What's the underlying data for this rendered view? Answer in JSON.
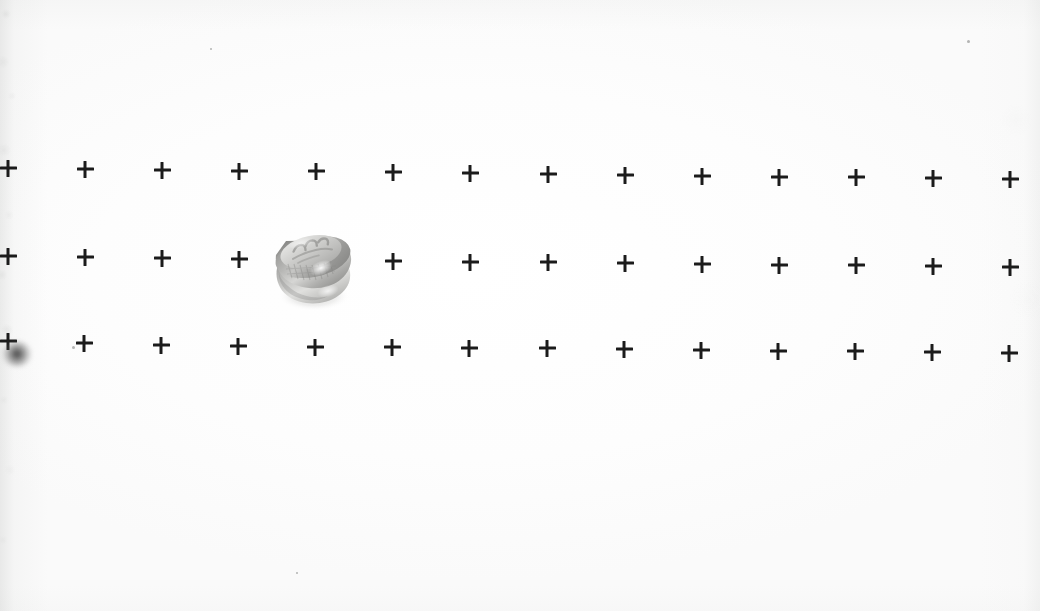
{
  "scene": {
    "width": 1040,
    "height": 611,
    "background_color": "#fefefe",
    "description": "Scanned photograph of a small machined metal cap resting on a white calibration sheet printed with a grid of bold plus-sign fiducial marks",
    "media": "grayscale halftone print on white paper"
  },
  "grid": {
    "label": "calibration fiducial grid",
    "rows": 3,
    "columns": 14,
    "column_spacing_px": 77,
    "row_spacing_px": 88,
    "cross_size_px": 17,
    "cross_stroke_px": 3,
    "cross_color": "#1b1b1b",
    "tilt_note": "grid drifts ~10px lower toward the right edge",
    "row_labels": [
      "row-1",
      "row-2",
      "row-3"
    ],
    "marks": [
      {
        "row": 1,
        "col": 1,
        "x": 8,
        "y": 168,
        "clipped": true,
        "occluded": false
      },
      {
        "row": 1,
        "col": 2,
        "x": 85,
        "y": 169,
        "clipped": false,
        "occluded": false
      },
      {
        "row": 1,
        "col": 3,
        "x": 162,
        "y": 170,
        "clipped": false,
        "occluded": false
      },
      {
        "row": 1,
        "col": 4,
        "x": 239,
        "y": 171,
        "clipped": false,
        "occluded": false
      },
      {
        "row": 1,
        "col": 5,
        "x": 316,
        "y": 171,
        "clipped": false,
        "occluded": false
      },
      {
        "row": 1,
        "col": 6,
        "x": 393,
        "y": 172,
        "clipped": false,
        "occluded": false
      },
      {
        "row": 1,
        "col": 7,
        "x": 470,
        "y": 173,
        "clipped": false,
        "occluded": false
      },
      {
        "row": 1,
        "col": 8,
        "x": 548,
        "y": 174,
        "clipped": false,
        "occluded": false
      },
      {
        "row": 1,
        "col": 9,
        "x": 625,
        "y": 175,
        "clipped": false,
        "occluded": false
      },
      {
        "row": 1,
        "col": 10,
        "x": 702,
        "y": 176,
        "clipped": false,
        "occluded": false
      },
      {
        "row": 1,
        "col": 11,
        "x": 779,
        "y": 177,
        "clipped": false,
        "occluded": false
      },
      {
        "row": 1,
        "col": 12,
        "x": 856,
        "y": 177,
        "clipped": false,
        "occluded": false
      },
      {
        "row": 1,
        "col": 13,
        "x": 933,
        "y": 178,
        "clipped": false,
        "occluded": false
      },
      {
        "row": 1,
        "col": 14,
        "x": 1010,
        "y": 179,
        "clipped": true,
        "occluded": false
      },
      {
        "row": 2,
        "col": 1,
        "x": 8,
        "y": 256,
        "clipped": true,
        "occluded": false
      },
      {
        "row": 2,
        "col": 2,
        "x": 85,
        "y": 257,
        "clipped": false,
        "occluded": false
      },
      {
        "row": 2,
        "col": 3,
        "x": 162,
        "y": 258,
        "clipped": false,
        "occluded": false
      },
      {
        "row": 2,
        "col": 4,
        "x": 239,
        "y": 259,
        "clipped": false,
        "occluded": false
      },
      {
        "row": 2,
        "col": 5,
        "x": 316,
        "y": 260,
        "clipped": false,
        "occluded": true
      },
      {
        "row": 2,
        "col": 6,
        "x": 393,
        "y": 261,
        "clipped": false,
        "occluded": false
      },
      {
        "row": 2,
        "col": 7,
        "x": 470,
        "y": 262,
        "clipped": false,
        "occluded": false
      },
      {
        "row": 2,
        "col": 8,
        "x": 548,
        "y": 262,
        "clipped": false,
        "occluded": false
      },
      {
        "row": 2,
        "col": 9,
        "x": 625,
        "y": 263,
        "clipped": false,
        "occluded": false
      },
      {
        "row": 2,
        "col": 10,
        "x": 702,
        "y": 264,
        "clipped": false,
        "occluded": false
      },
      {
        "row": 2,
        "col": 11,
        "x": 779,
        "y": 265,
        "clipped": false,
        "occluded": false
      },
      {
        "row": 2,
        "col": 12,
        "x": 856,
        "y": 265,
        "clipped": false,
        "occluded": false
      },
      {
        "row": 2,
        "col": 13,
        "x": 933,
        "y": 266,
        "clipped": false,
        "occluded": false
      },
      {
        "row": 2,
        "col": 14,
        "x": 1010,
        "y": 267,
        "clipped": true,
        "occluded": false
      },
      {
        "row": 3,
        "col": 1,
        "x": 8,
        "y": 341,
        "clipped": true,
        "occluded": false
      },
      {
        "row": 3,
        "col": 2,
        "x": 84,
        "y": 343,
        "clipped": false,
        "occluded": false
      },
      {
        "row": 3,
        "col": 3,
        "x": 161,
        "y": 345,
        "clipped": false,
        "occluded": false
      },
      {
        "row": 3,
        "col": 4,
        "x": 238,
        "y": 346,
        "clipped": false,
        "occluded": false
      },
      {
        "row": 3,
        "col": 5,
        "x": 315,
        "y": 347,
        "clipped": false,
        "occluded": false
      },
      {
        "row": 3,
        "col": 6,
        "x": 392,
        "y": 347,
        "clipped": false,
        "occluded": false
      },
      {
        "row": 3,
        "col": 7,
        "x": 469,
        "y": 348,
        "clipped": false,
        "occluded": false
      },
      {
        "row": 3,
        "col": 8,
        "x": 547,
        "y": 348,
        "clipped": false,
        "occluded": false
      },
      {
        "row": 3,
        "col": 9,
        "x": 624,
        "y": 349,
        "clipped": false,
        "occluded": false
      },
      {
        "row": 3,
        "col": 10,
        "x": 701,
        "y": 350,
        "clipped": false,
        "occluded": false
      },
      {
        "row": 3,
        "col": 11,
        "x": 778,
        "y": 351,
        "clipped": false,
        "occluded": false
      },
      {
        "row": 3,
        "col": 12,
        "x": 855,
        "y": 351,
        "clipped": false,
        "occluded": false
      },
      {
        "row": 3,
        "col": 13,
        "x": 932,
        "y": 352,
        "clipped": false,
        "occluded": false
      },
      {
        "row": 3,
        "col": 14,
        "x": 1009,
        "y": 353,
        "clipped": true,
        "occluded": false
      }
    ]
  },
  "artifacts": [
    {
      "name": "ink-smudge",
      "label": "dark ink blur at left edge of row 3",
      "x": 2,
      "y": 341,
      "w": 30,
      "h": 26
    },
    {
      "name": "speck-a",
      "label": "small dust speck right of row-3 first mark",
      "x": 72,
      "y": 346,
      "w": 3,
      "h": 3
    },
    {
      "name": "speck-b",
      "label": "faint dust speck upper right",
      "x": 967,
      "y": 40,
      "w": 3,
      "h": 3
    },
    {
      "name": "speck-c",
      "label": "faint paper fleck",
      "x": 210,
      "y": 48,
      "w": 2,
      "h": 2
    },
    {
      "name": "speck-d",
      "label": "faint paper fleck lower area",
      "x": 296,
      "y": 572,
      "w": 2,
      "h": 2
    }
  ],
  "object": {
    "name": "metal cap",
    "label": "machined metal cap / nut",
    "finish": "brushed aluminium, grayscale halftone",
    "orientation": "tilted, viewed from above-left",
    "bounds": {
      "x": 270,
      "y": 230,
      "w": 84,
      "h": 78
    },
    "top_face_marking": "illegible embossed lettering",
    "occludes_mark": "row-2 column-5",
    "colors": {
      "highlight": "#f2f2f0",
      "body_light": "#d8d8d6",
      "body_mid": "#b9b9b7",
      "body_dark": "#9a9a98",
      "shadow": "#7e7e7c",
      "deep_shadow": "#6a6a68",
      "cast_shadow": "#c9c9c7"
    }
  }
}
